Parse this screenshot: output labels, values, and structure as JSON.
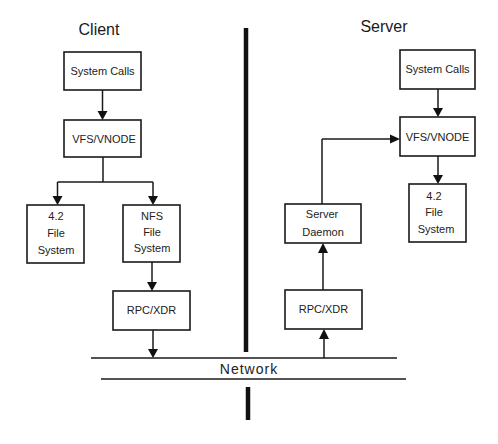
{
  "diagram": {
    "sides": {
      "client": {
        "title": "Client"
      },
      "server": {
        "title": "Server"
      }
    },
    "network": {
      "label": "Network"
    },
    "client_boxes": {
      "system_calls": {
        "lines": [
          "System Calls"
        ]
      },
      "vfs": {
        "lines": [
          "VFS/VNODE"
        ]
      },
      "fs42": {
        "lines": [
          "4.2",
          "File",
          "System"
        ]
      },
      "nfs": {
        "lines": [
          "NFS",
          "File",
          "System"
        ]
      },
      "rpc": {
        "lines": [
          "RPC/XDR"
        ]
      }
    },
    "server_boxes": {
      "system_calls": {
        "lines": [
          "System Calls"
        ]
      },
      "vfs": {
        "lines": [
          "VFS/VNODE"
        ]
      },
      "fs42": {
        "lines": [
          "4.2",
          "File",
          "System"
        ]
      },
      "daemon": {
        "lines": [
          "Server",
          "Daemon"
        ]
      },
      "rpc": {
        "lines": [
          "RPC/XDR"
        ]
      }
    },
    "edges": [
      {
        "from": "client.system_calls",
        "to": "client.vfs"
      },
      {
        "from": "client.vfs",
        "to": "client.fs42"
      },
      {
        "from": "client.vfs",
        "to": "client.nfs"
      },
      {
        "from": "client.nfs",
        "to": "client.rpc"
      },
      {
        "from": "client.rpc",
        "to": "network"
      },
      {
        "from": "network",
        "to": "server.rpc"
      },
      {
        "from": "server.rpc",
        "to": "server.daemon"
      },
      {
        "from": "server.daemon",
        "to": "server.vfs"
      },
      {
        "from": "server.system_calls",
        "to": "server.vfs"
      },
      {
        "from": "server.vfs",
        "to": "server.fs42"
      }
    ],
    "colors": {
      "stroke": "#1a1a1a",
      "background": "#ffffff"
    }
  }
}
